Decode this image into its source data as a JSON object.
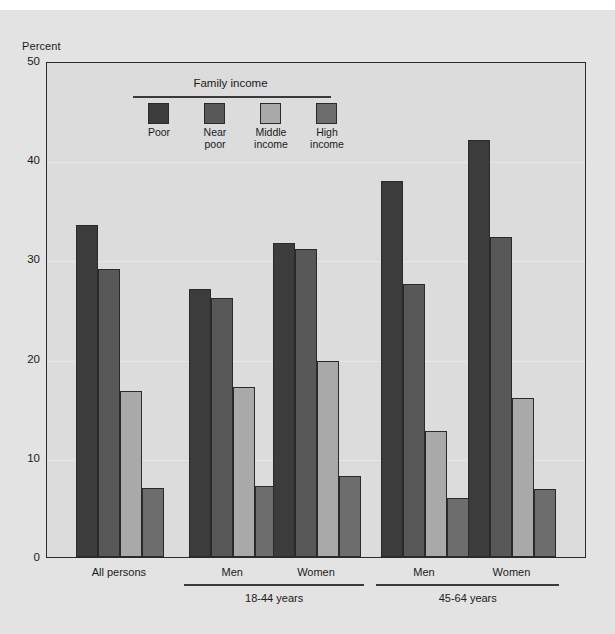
{
  "chart_data": {
    "type": "bar",
    "title": "",
    "subtitle": "",
    "xlabel": "",
    "ylabel": "Percent",
    "ylim": [
      0,
      50
    ],
    "yticks": [
      0,
      10,
      20,
      30,
      40,
      50
    ],
    "grid": true,
    "legend": {
      "title": "Family income",
      "position": "inside-top-left",
      "entries": [
        {
          "name": "Poor",
          "lines": [
            "Poor"
          ],
          "color": "#3c3c3c"
        },
        {
          "name": "Near poor",
          "lines": [
            "Near",
            "poor"
          ],
          "color": "#585858"
        },
        {
          "name": "Middle income",
          "lines": [
            "Middle",
            "income"
          ],
          "color": "#a9a9a9"
        },
        {
          "name": "High income",
          "lines": [
            "High",
            "income"
          ],
          "color": "#6d6d6d"
        }
      ]
    },
    "categories": [
      "All persons",
      "Men",
      "Women",
      "Men",
      "Women"
    ],
    "category_groups": [
      {
        "label": "",
        "members": [
          "All persons"
        ]
      },
      {
        "label": "18-44 years",
        "members": [
          "Men",
          "Women"
        ]
      },
      {
        "label": "45-64 years",
        "members": [
          "Men",
          "Women"
        ]
      }
    ],
    "series": [
      {
        "name": "Poor",
        "values": [
          33.5,
          27.0,
          31.7,
          37.9,
          42.0
        ]
      },
      {
        "name": "Near poor",
        "values": [
          29.0,
          26.1,
          31.0,
          27.5,
          32.3
        ]
      },
      {
        "name": "Middle income",
        "values": [
          16.7,
          17.1,
          19.8,
          12.7,
          16.0
        ]
      },
      {
        "name": "High income",
        "values": [
          7.0,
          7.2,
          8.2,
          5.9,
          6.9
        ]
      }
    ]
  },
  "axis": {
    "y_title": "Percent",
    "y_ticks": [
      "50",
      "40",
      "30",
      "20",
      "10",
      "0"
    ]
  },
  "groups": [
    {
      "label": "All persons",
      "super": ""
    },
    {
      "label": "Men",
      "super": "18-44 years"
    },
    {
      "label": "Women",
      "super": "18-44 years"
    },
    {
      "label": "Men",
      "super": "45-64 years"
    },
    {
      "label": "Women",
      "super": "45-64 years"
    }
  ],
  "super_labels": [
    "18-44 years",
    "45-64 years"
  ],
  "legend": {
    "title": "Family income",
    "items": [
      {
        "line1": "Poor",
        "line2": "",
        "color": "#3c3c3c"
      },
      {
        "line1": "Near",
        "line2": "poor",
        "color": "#585858"
      },
      {
        "line1": "Middle",
        "line2": "income",
        "color": "#a9a9a9"
      },
      {
        "line1": "High",
        "line2": "income",
        "color": "#6d6d6d"
      }
    ]
  },
  "colors": {
    "figure_background": "#e3e3e3",
    "plot_background": "#dcdcdc",
    "frame": "#2b2b2b",
    "text": "#1a1a1a"
  }
}
